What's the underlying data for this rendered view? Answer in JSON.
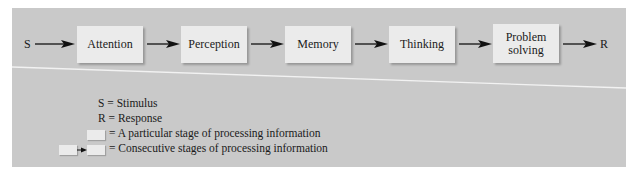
{
  "diagram": {
    "input_label": "S",
    "output_label": "R",
    "stages": [
      {
        "label": "Attention"
      },
      {
        "label": "Perception"
      },
      {
        "label": "Memory"
      },
      {
        "label": "Thinking"
      },
      {
        "label": "Problem solving"
      }
    ]
  },
  "legend": {
    "items": [
      {
        "symbol": "S",
        "text": "= Stimulus"
      },
      {
        "symbol": "R",
        "text": "= Response"
      },
      {
        "symbol": "box",
        "text": "= A particular stage of processing information"
      },
      {
        "symbol": "box-arrow-box",
        "text": "= Consecutive stages of processing information"
      }
    ]
  },
  "colors": {
    "panel": "#c9c9c9",
    "box": "#ebebeb",
    "arrow": "#111111",
    "divider": "#f2f2f2"
  }
}
